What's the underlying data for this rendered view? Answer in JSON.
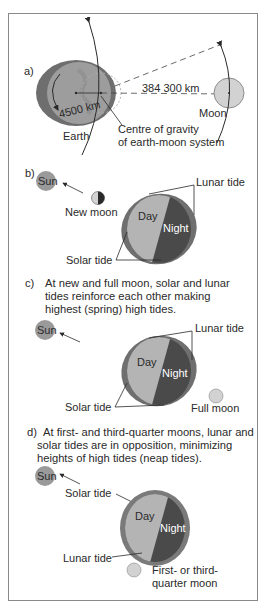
{
  "panel_a": {
    "label": "a)",
    "distance": "384 300 km",
    "radius": "4500 km",
    "earth": "Earth",
    "moon": "Moon",
    "barycenter_line1": "Centre of gravity",
    "barycenter_line2": "of earth-moon system"
  },
  "panel_b": {
    "label": "b)",
    "sun": "Sun",
    "moon": "New moon",
    "lunar_tide": "Lunar tide",
    "solar_tide": "Solar tide",
    "day": "Day",
    "night": "Night"
  },
  "panel_c": {
    "label": "c)",
    "caption_line1": "At new and full moon, solar and lunar",
    "caption_line2": "tides reinforce each other making",
    "caption_line3": "highest (spring) high tides.",
    "sun": "Sun",
    "lunar_tide": "Lunar tide",
    "solar_tide": "Solar tide",
    "day": "Day",
    "night": "Night",
    "moon": "Full moon"
  },
  "panel_d": {
    "label": "d)",
    "caption_line1": "At first- and third-quarter moons, lunar and",
    "caption_line2": "solar tides are in opposition, minimizing",
    "caption_line3": "heights of high tides (neap tides).",
    "sun": "Sun",
    "solar_tide": "Solar tide",
    "lunar_tide": "Lunar tide",
    "day": "Day",
    "night": "Night",
    "moon_line1": "First- or third-",
    "moon_line2": "quarter moon"
  },
  "colors": {
    "ocean_bulge": "#7a7a7a",
    "day_side": "#b4b4b4",
    "night_side": "#4a4a4a",
    "sun": "#9a9a9a",
    "moon": "#d2d2d2",
    "frame": "#8a8a8a"
  }
}
